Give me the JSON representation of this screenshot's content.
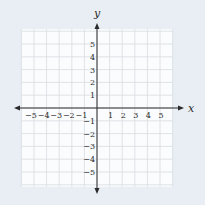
{
  "chart_data": {
    "type": "scatter",
    "title": "",
    "xlabel": "x",
    "ylabel": "y",
    "xlim": [
      -5,
      5
    ],
    "ylim": [
      -5,
      5
    ],
    "x_ticks": [
      -5,
      -4,
      -3,
      -2,
      -1,
      1,
      2,
      3,
      4,
      5
    ],
    "y_ticks": [
      -5,
      -4,
      -3,
      -2,
      -1,
      1,
      2,
      3,
      4,
      5
    ],
    "x_tick_labels": [
      "−5",
      "−4",
      "−3",
      "−2",
      "−1",
      "1",
      "2",
      "3",
      "4",
      "5"
    ],
    "y_tick_labels": [
      "−5",
      "−4",
      "−3",
      "−2",
      "−1",
      "1",
      "2",
      "3",
      "4",
      "5"
    ],
    "grid": true,
    "grid_extent": [
      -6,
      6
    ],
    "series": []
  },
  "colors": {
    "background": "#e8eef3",
    "grid_fill": "#fbfcfd",
    "grid_line": "#d7dde2",
    "axis": "#2b2b2b",
    "text": "#2b2b2b"
  }
}
